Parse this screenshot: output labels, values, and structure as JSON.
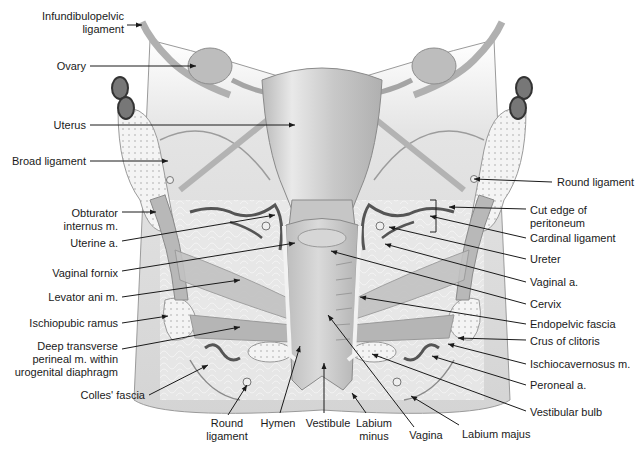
{
  "diagram": {
    "colors": {
      "line": "#1a1a1a",
      "tissue": "#cfcfcf",
      "tissue_dark": "#a8a8a8",
      "bone": "#f2f2f2",
      "vessel": "#555555",
      "fat": "#e6e6e6"
    },
    "labels": [
      {
        "id": "infundibulopelvic-ligament",
        "text": "Infundibulopelvic\nligament",
        "x": 2,
        "y": 10,
        "w": 122,
        "align": "r",
        "lx1": 127,
        "ly1": 25,
        "lx2": 142,
        "ly2": 25
      },
      {
        "id": "ovary",
        "text": "Ovary",
        "x": 2,
        "y": 60,
        "w": 84,
        "align": "r",
        "lx1": 90,
        "ly1": 66,
        "lx2": 196,
        "ly2": 66
      },
      {
        "id": "uterus",
        "text": "Uterus",
        "x": 2,
        "y": 119,
        "w": 84,
        "align": "r",
        "lx1": 90,
        "ly1": 125,
        "lx2": 295,
        "ly2": 125
      },
      {
        "id": "broad-ligament",
        "text": "Broad ligament",
        "x": 2,
        "y": 155,
        "w": 84,
        "align": "r",
        "lx1": 90,
        "ly1": 161,
        "lx2": 168,
        "ly2": 161
      },
      {
        "id": "obturator-internus",
        "text": "Obturator\ninternus m.",
        "x": 2,
        "y": 207,
        "w": 116,
        "align": "r",
        "lx1": 122,
        "ly1": 212,
        "lx2": 156,
        "ly2": 212
      },
      {
        "id": "uterine-artery",
        "text": "Uterine a.",
        "x": 2,
        "y": 237,
        "w": 116,
        "align": "r",
        "lx1": 122,
        "ly1": 241,
        "lx2": 275,
        "ly2": 215
      },
      {
        "id": "vaginal-fornix",
        "text": "Vaginal fornix",
        "x": 2,
        "y": 267,
        "w": 116,
        "align": "r",
        "lx1": 122,
        "ly1": 271,
        "lx2": 295,
        "ly2": 243
      },
      {
        "id": "levator-ani",
        "text": "Levator ani m.",
        "x": 2,
        "y": 291,
        "w": 116,
        "align": "r",
        "lx1": 122,
        "ly1": 297,
        "lx2": 240,
        "ly2": 280
      },
      {
        "id": "ischiopubic-ramus",
        "text": "Ischiopubic ramus",
        "x": 2,
        "y": 317,
        "w": 116,
        "align": "r",
        "lx1": 122,
        "ly1": 323,
        "lx2": 168,
        "ly2": 316
      },
      {
        "id": "deep-transverse-perineal",
        "text": "Deep transverse\nperineal m. within\nurogenital diaphragm",
        "x": 2,
        "y": 340,
        "w": 116,
        "align": "r",
        "lx1": 122,
        "ly1": 349,
        "lx2": 240,
        "ly2": 327
      },
      {
        "id": "colles-fascia",
        "text": "Colles' fascia",
        "x": 2,
        "y": 389,
        "w": 143,
        "align": "r",
        "lx1": 149,
        "ly1": 395,
        "lx2": 208,
        "ly2": 365
      },
      {
        "id": "round-ligament-bottom",
        "text": "Round\nligament",
        "x": 202,
        "y": 417,
        "w": 50,
        "align": "c",
        "lx1": 228,
        "ly1": 415,
        "lx2": 247,
        "ly2": 385
      },
      {
        "id": "hymen",
        "text": "Hymen",
        "x": 256,
        "y": 417,
        "w": 44,
        "align": "c",
        "lx1": 280,
        "ly1": 413,
        "lx2": 300,
        "ly2": 346
      },
      {
        "id": "vestibule",
        "text": "Vestibule",
        "x": 300,
        "y": 417,
        "w": 56,
        "align": "c",
        "lx1": 324,
        "ly1": 413,
        "lx2": 324,
        "ly2": 363
      },
      {
        "id": "labium-minus",
        "text": "Labium\nminus",
        "x": 352,
        "y": 417,
        "w": 44,
        "align": "c",
        "lx1": 366,
        "ly1": 413,
        "lx2": 352,
        "ly2": 393
      },
      {
        "id": "vagina",
        "text": "Vagina",
        "x": 404,
        "y": 429,
        "w": 44,
        "align": "c",
        "lx1": 414,
        "ly1": 427,
        "lx2": 328,
        "ly2": 315
      },
      {
        "id": "labium-majus",
        "text": "Labium majus",
        "x": 462,
        "y": 428,
        "w": 84,
        "align": "l",
        "lx1": 459,
        "ly1": 425,
        "lx2": 411,
        "ly2": 396
      },
      {
        "id": "round-ligament-right",
        "text": "Round ligament",
        "x": 557,
        "y": 176,
        "w": 86,
        "align": "l",
        "lx1": 552,
        "ly1": 182,
        "lx2": 474,
        "ly2": 179
      },
      {
        "id": "cut-edge-peritoneum",
        "text": "Cut edge of\nperitoneum",
        "x": 530,
        "y": 204,
        "w": 100,
        "align": "l",
        "lx1": 526,
        "ly1": 209,
        "lx2": 449,
        "ly2": 207
      },
      {
        "id": "cardinal-ligament",
        "text": "Cardinal ligament",
        "x": 530,
        "y": 232,
        "w": 100,
        "align": "l",
        "lx1": 526,
        "ly1": 238,
        "lx2": 430,
        "ly2": 216
      },
      {
        "id": "ureter",
        "text": "Ureter",
        "x": 530,
        "y": 253,
        "w": 100,
        "align": "l",
        "lx1": 526,
        "ly1": 259,
        "lx2": 389,
        "ly2": 227
      },
      {
        "id": "vaginal-artery",
        "text": "Vaginal a.",
        "x": 530,
        "y": 276,
        "w": 100,
        "align": "l",
        "lx1": 526,
        "ly1": 282,
        "lx2": 385,
        "ly2": 244
      },
      {
        "id": "cervix",
        "text": "Cervix",
        "x": 530,
        "y": 298,
        "w": 100,
        "align": "l",
        "lx1": 526,
        "ly1": 304,
        "lx2": 331,
        "ly2": 251
      },
      {
        "id": "endopelvic-fascia",
        "text": "Endopelvic fascia",
        "x": 530,
        "y": 318,
        "w": 110,
        "align": "l",
        "lx1": 526,
        "ly1": 324,
        "lx2": 360,
        "ly2": 297
      },
      {
        "id": "crus-of-clitoris",
        "text": "Crus of clitoris",
        "x": 530,
        "y": 335,
        "w": 110,
        "align": "l",
        "lx1": 526,
        "ly1": 340,
        "lx2": 458,
        "ly2": 338
      },
      {
        "id": "ischiocavernosus",
        "text": "Ischiocavernosus m.",
        "x": 530,
        "y": 358,
        "w": 112,
        "align": "l",
        "lx1": 526,
        "ly1": 364,
        "lx2": 448,
        "ly2": 344
      },
      {
        "id": "peroneal-artery",
        "text": "Peroneal a.",
        "x": 530,
        "y": 379,
        "w": 100,
        "align": "l",
        "lx1": 526,
        "ly1": 385,
        "lx2": 432,
        "ly2": 356
      },
      {
        "id": "vestibular-bulb",
        "text": "Vestibular bulb",
        "x": 530,
        "y": 406,
        "w": 100,
        "align": "l",
        "lx1": 526,
        "ly1": 411,
        "lx2": 372,
        "ly2": 354
      }
    ]
  }
}
